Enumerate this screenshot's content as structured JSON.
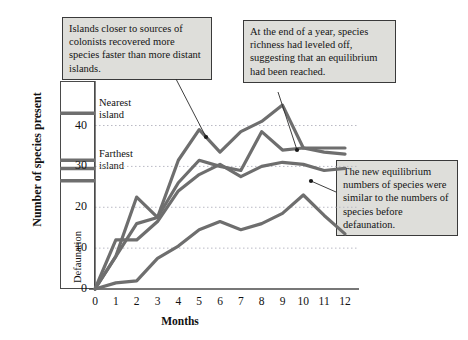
{
  "chart_data": {
    "type": "line",
    "title": "",
    "xlabel": "Months",
    "ylabel": "Number of species present",
    "x": [
      0,
      1,
      2,
      3,
      4,
      5,
      6,
      7,
      8,
      9,
      10,
      11,
      12
    ],
    "xlim": [
      0,
      12
    ],
    "ylim": [
      0,
      46
    ],
    "yticks": [
      0,
      10,
      20,
      30,
      40
    ],
    "xticks": [
      "0",
      "1",
      "2",
      "3",
      "4",
      "5",
      "6",
      "7",
      "8",
      "9",
      "10",
      "11",
      "12"
    ],
    "grid": "horizontal-dotted",
    "legend_position": "inline-left",
    "series": [
      {
        "name": "Nearest island",
        "color": "#6e6e6e",
        "values": [
          0,
          8,
          22.5,
          17.5,
          31.5,
          39,
          33.5,
          38.5,
          41,
          45,
          34.5,
          34.5,
          34.5
        ]
      },
      {
        "name": "Island 2",
        "color": "#6e6e6e",
        "values": [
          0,
          8,
          16,
          17.5,
          26,
          31.5,
          30,
          29,
          38.5,
          34,
          34.5,
          33.5,
          33
        ]
      },
      {
        "name": "Island 3",
        "color": "#6e6e6e",
        "values": [
          0,
          12,
          12,
          16.5,
          24,
          28,
          30.5,
          27.5,
          30,
          31,
          30.5,
          29,
          29.5
        ]
      },
      {
        "name": "Farthest island",
        "color": "#6e6e6e",
        "values": [
          0,
          1.5,
          2,
          7.5,
          10.5,
          14.5,
          16.5,
          14.5,
          16,
          18.5,
          23,
          18,
          13.5
        ]
      }
    ],
    "predefaunation_markers": {
      "label": "Defaunation",
      "description": "Horizontal bars marking species numbers before defaunation",
      "color": "#6e6e6e",
      "values": [
        43,
        31.5,
        29.5,
        26.5
      ]
    }
  },
  "series_labels": {
    "nearest": "Nearest\nisland",
    "nearest_line1": "Nearest",
    "nearest_line2": "island",
    "farthest_line1": "Farthest",
    "farthest_line2": "island",
    "defaunation": "Defaunation"
  },
  "annotations": [
    {
      "id": "callout-left",
      "text": "Islands closer to sources of colonists recovered more species faster than more distant islands."
    },
    {
      "id": "callout-right",
      "text": "At the end of a year, species richness had leveled off, suggesting that an equilibrium had been reached."
    },
    {
      "id": "callout-lower",
      "text": "The new equilibrium numbers of species were similar to the numbers of species before defaunation."
    }
  ],
  "colors": {
    "line": "#6e6e6e",
    "axis": "#4a4a4a",
    "grid": "#b9b9c4",
    "callout_bg": "#dededa",
    "callout_border": "#3a3a3a",
    "text": "#141414"
  }
}
